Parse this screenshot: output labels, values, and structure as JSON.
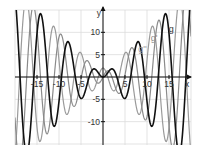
{
  "chart_data": {
    "type": "line",
    "title": "",
    "xlabel": "x",
    "ylabel": "y",
    "xlim": [
      -20,
      20
    ],
    "ylim": [
      -15,
      15
    ],
    "grid": true,
    "grid_step": 5,
    "x_ticks": [
      -15,
      -10,
      -5,
      5,
      10,
      15
    ],
    "y_ticks": [
      10,
      5,
      -5,
      -10
    ],
    "series": [
      {
        "name": "g",
        "expression": "x*sin(x)",
        "color": "#111111",
        "width": 1.6
      },
      {
        "name": "g'",
        "expression": "sin(x)+x*cos(x)",
        "color": "#8a8a8a",
        "width": 1.2
      },
      {
        "name": "g''",
        "expression": "2*cos(x)-x*sin(x)",
        "color": "#9a9a9a",
        "width": 1.2
      }
    ],
    "annotations": [
      {
        "text": "g''",
        "x": 9.0,
        "y": 5.5,
        "color": "#9a9a9a"
      },
      {
        "text": "g'",
        "x": 11.6,
        "y": 8.0,
        "color": "#8a8a8a"
      },
      {
        "text": "g",
        "x": 15.5,
        "y": 10.0,
        "color": "#333333"
      }
    ]
  },
  "layout": {
    "plot_left": 15,
    "plot_right": 191,
    "plot_top": 10,
    "plot_bottom": 145,
    "origin_x": 103,
    "origin_y": 77,
    "grid_color": "#dcdcdc",
    "axis_color": "#111111"
  }
}
